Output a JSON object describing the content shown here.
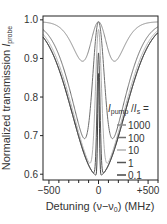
{
  "chart_data": {
    "type": "line",
    "title": "",
    "xlabel": "Detuning (ν−ν0) (MHz)",
    "ylabel": "Normalized transmission I_probe",
    "xlim": [
      -560,
      600
    ],
    "ylim": [
      0.585,
      1.01
    ],
    "xticks": [
      -500,
      0,
      500
    ],
    "xtick_labels": [
      "−500",
      "0",
      "+500"
    ],
    "yticks": [
      0.6,
      0.7,
      0.8,
      0.9,
      1.0
    ],
    "ytick_labels": [
      "0.6",
      "0.7",
      "0.8",
      "0.9",
      "1.0"
    ],
    "grid": false,
    "legend": {
      "title": "I_pump / I_s =",
      "position": "right inside",
      "entries": [
        "1000",
        "100",
        "10",
        "1",
        "0.1"
      ]
    },
    "series": [
      {
        "name": "1000",
        "color": "#8a8a8a",
        "dip_depth": 0.21,
        "dip_width_mhz": 170,
        "hole_width_mhz": 95,
        "hole_depth": 0.0
      },
      {
        "name": "100",
        "color": "#6e6e6e",
        "dip_depth": 0.39,
        "dip_width_mhz": 230,
        "hole_width_mhz": 60,
        "hole_depth": 0.0
      },
      {
        "name": "10",
        "color": "#b0b0b0",
        "dip_depth": 0.395,
        "dip_width_mhz": 250,
        "hole_width_mhz": 30,
        "hole_depth": 0.05
      },
      {
        "name": "1",
        "color": "#555555",
        "dip_depth": 0.4,
        "dip_width_mhz": 260,
        "hole_width_mhz": 15,
        "hole_depth": 0.2
      },
      {
        "name": "0.1",
        "color": "#444444",
        "dip_depth": 0.4,
        "dip_width_mhz": 260,
        "hole_width_mhz": 8,
        "hole_depth": 0.33
      }
    ]
  },
  "axes": {
    "ylabel_main": "Normalized transmission ",
    "ylabel_var": "I",
    "ylabel_sub": "probe",
    "xlabel_main": "Detuning (ν−ν",
    "xlabel_sub": "0",
    "xlabel_end": ") (MHz)"
  },
  "legend_title": {
    "var": "I",
    "sub1": "pump",
    "mid": " /",
    "var2": "I",
    "sub2": "s",
    "end": " ="
  }
}
